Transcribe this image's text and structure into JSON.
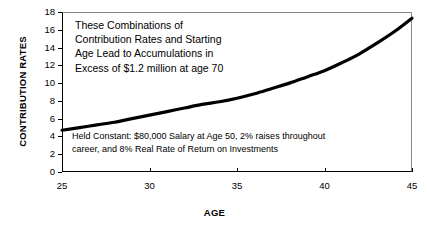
{
  "chart_data": {
    "type": "line",
    "title": "",
    "xlabel": "AGE",
    "ylabel": "CONTRIBUTION RATES",
    "xlim": [
      25,
      45
    ],
    "ylim": [
      0,
      18
    ],
    "xticks": [
      25,
      30,
      35,
      40,
      45
    ],
    "yticks": [
      0,
      2,
      4,
      6,
      8,
      10,
      12,
      14,
      16,
      18
    ],
    "grid": false,
    "legend": false,
    "line_color": "#000000",
    "series": [
      {
        "name": "Required Contribution Rate",
        "x": [
          25,
          26,
          27,
          28,
          29,
          30,
          31,
          32,
          33,
          34,
          35,
          36,
          37,
          38,
          39,
          40,
          41,
          42,
          43,
          44,
          45
        ],
        "values": [
          4.7,
          5.0,
          5.3,
          5.6,
          6.0,
          6.4,
          6.8,
          7.2,
          7.6,
          7.9,
          8.3,
          8.8,
          9.4,
          10.0,
          10.7,
          11.4,
          12.3,
          13.3,
          14.5,
          15.8,
          17.3
        ]
      }
    ],
    "annotations": [
      {
        "id": "main",
        "text": "These Combinations of\nContribution Rates and Starting\nAge Lead to Accumulations in\nExcess of $1.2 million at age 70"
      },
      {
        "id": "note",
        "text": "Held Constant: $80,000 Salary at Age 50, 2% raises throughout\ncareer, and 8% Real Rate of Return on Investments"
      }
    ]
  },
  "axis": {
    "y_title": "CONTRIBUTION RATES",
    "x_title": "AGE",
    "y_tick_labels": [
      "18",
      "16",
      "14",
      "12",
      "10",
      "8",
      "6",
      "4",
      "2",
      "0"
    ],
    "x_tick_labels": [
      "25",
      "30",
      "35",
      "40",
      "45"
    ]
  },
  "annotations": {
    "main": "These Combinations of\nContribution Rates and Starting\nAge Lead to Accumulations in\nExcess of $1.2 million at age 70",
    "note": "Held Constant: $80,000 Salary at Age 50, 2% raises throughout\ncareer, and 8% Real Rate of Return on Investments"
  }
}
